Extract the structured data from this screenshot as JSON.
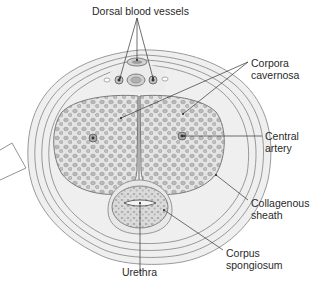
{
  "diagram": {
    "type": "anatomical cross-section",
    "colors": {
      "background": "#ffffff",
      "tissue_light": "#ececec",
      "tissue_mid": "#d6d6d6",
      "line": "#8a8a8a",
      "leader": "#333333",
      "text": "#2a2a2a"
    },
    "labels": {
      "dorsal_vessels": "Dorsal blood vessels",
      "corpora_line1": "Corpora",
      "corpora_line2": "cavernosa",
      "central_line1": "Central",
      "central_line2": "artery",
      "collagenous_line1": "Collagenous",
      "collagenous_line2": "sheath",
      "corpus_line1": "Corpus",
      "corpus_line2": "spongiosum",
      "urethra": "Urethra"
    }
  }
}
